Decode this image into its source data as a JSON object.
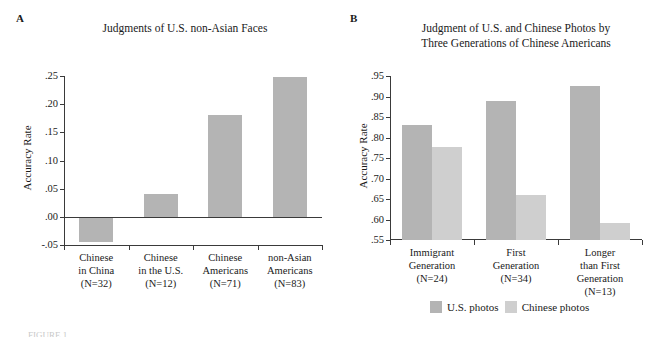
{
  "figure": {
    "panel_a_letter": "A",
    "panel_b_letter": "B",
    "footer_fragment": "FIGURE 1"
  },
  "colors": {
    "bar_dark": "#b4b4b4",
    "bar_light": "#cfcfcf",
    "axis": "#3a3a3a",
    "text": "#1a1a1a",
    "background": "#ffffff"
  },
  "chart_data": [
    {
      "type": "bar",
      "panel": "A",
      "title": "Judgments of U.S. non-Asian Faces",
      "xlabel": "",
      "ylabel": "Accuracy Rate",
      "ylim": [
        -0.05,
        0.25
      ],
      "yticks": [
        ".25",
        ".20",
        ".15",
        ".10",
        ".05",
        ".00",
        "-.05"
      ],
      "ytick_values": [
        0.25,
        0.2,
        0.15,
        0.1,
        0.05,
        0.0,
        -0.05
      ],
      "grid": false,
      "legend": "none",
      "categories": [
        "Chinese\nin China\n(N=32)",
        "Chinese\nin the U.S.\n(N=12)",
        "Chinese\nAmericans\n(N=71)",
        "non-Asian\nAmericans\n(N=83)"
      ],
      "category_lines": [
        [
          "Chinese",
          "in China",
          "(N=32)"
        ],
        [
          "Chinese",
          "in the U.S.",
          "(N=12)"
        ],
        [
          "Chinese",
          "Americans",
          "(N=71)"
        ],
        [
          "non-Asian",
          "Americans",
          "(N=83)"
        ]
      ],
      "values": [
        -0.045,
        0.04,
        0.18,
        0.248
      ],
      "series_color": "#b4b4b4"
    },
    {
      "type": "bar",
      "panel": "B",
      "title": "Judgment of U.S. and Chinese Photos by\nThree Generations of Chinese Americans",
      "title_lines": [
        "Judgment of U.S. and Chinese Photos by",
        "Three Generations of Chinese Americans"
      ],
      "xlabel": "",
      "ylabel": "Accuracy Rate",
      "ylim": [
        0.55,
        0.95
      ],
      "yticks": [
        ".95",
        ".90",
        ".85",
        ".80",
        ".75",
        ".70",
        ".65",
        ".60",
        ".55"
      ],
      "ytick_values": [
        0.95,
        0.9,
        0.85,
        0.8,
        0.75,
        0.7,
        0.65,
        0.6,
        0.55
      ],
      "grid": false,
      "legend": "bottom-center",
      "categories": [
        "Immigrant\nGeneration\n(N=24)",
        "First\nGeneration\n(N=34)",
        "Longer\nthan First\nGeneration\n(N=13)"
      ],
      "category_lines": [
        [
          "Immigrant",
          "Generation",
          "(N=24)"
        ],
        [
          "First",
          "Generation",
          "(N=34)"
        ],
        [
          "Longer",
          "than First",
          "Generation",
          "(N=13)"
        ]
      ],
      "series": [
        {
          "name": "U.S. photos",
          "color": "#b4b4b4",
          "values": [
            0.83,
            0.888,
            0.925
          ]
        },
        {
          "name": "Chinese photos",
          "color": "#cfcfcf",
          "values": [
            0.778,
            0.659,
            0.592
          ]
        }
      ]
    }
  ]
}
